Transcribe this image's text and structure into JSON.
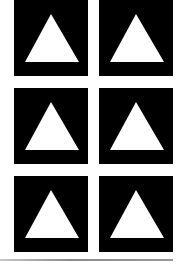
{
  "grid": {
    "rows": 3,
    "columns": 2,
    "tiles": [
      {
        "icon": "triangle-up-icon",
        "background": "#000000",
        "foreground": "#ffffff"
      },
      {
        "icon": "triangle-up-icon",
        "background": "#000000",
        "foreground": "#ffffff"
      },
      {
        "icon": "triangle-up-icon",
        "background": "#000000",
        "foreground": "#ffffff"
      },
      {
        "icon": "triangle-up-icon",
        "background": "#000000",
        "foreground": "#ffffff"
      },
      {
        "icon": "triangle-up-icon",
        "background": "#000000",
        "foreground": "#ffffff"
      },
      {
        "icon": "triangle-up-icon",
        "background": "#000000",
        "foreground": "#ffffff"
      }
    ]
  },
  "divider": {
    "color": "#8a8a8a"
  }
}
